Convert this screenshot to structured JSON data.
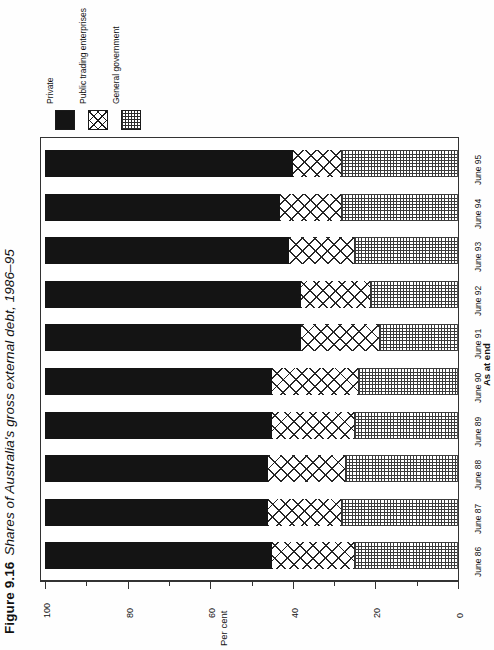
{
  "figure": {
    "number": "Figure 9.16",
    "title": "Shares of Australia's gross external debt, 1986–95"
  },
  "legend": {
    "items": [
      {
        "label": "Private",
        "swatch": "solid-black-swatch",
        "color": "#141414"
      },
      {
        "label": "Public trading enterprises",
        "swatch": "cross-hatch-swatch",
        "color": "#262626"
      },
      {
        "label": "General government",
        "swatch": "dotted-grid-swatch",
        "color": "#3a3a3a"
      }
    ]
  },
  "axes": {
    "value_axis_title": "Per cent",
    "value_ticks": [
      "100",
      "80",
      "60",
      "40",
      "20",
      "0"
    ],
    "category_axis_title": "As at end"
  },
  "chart_data": {
    "type": "bar",
    "orientation": "horizontal-stacked",
    "title": "Shares of Australia's gross external debt, 1986–95",
    "xlabel": "Per cent",
    "ylabel": "As at end",
    "xlim": [
      0,
      100
    ],
    "x_axis_reversed": true,
    "grid": false,
    "legend_position": "top-left",
    "categories": [
      "June 86",
      "June 87",
      "June 88",
      "June 89",
      "June 90",
      "June 91",
      "June 92",
      "June 93",
      "June 94",
      "June 95"
    ],
    "series": [
      {
        "name": "Private",
        "values": [
          55,
          54,
          54,
          55,
          55,
          62,
          62,
          59,
          57,
          60
        ]
      },
      {
        "name": "Public trading enterprises",
        "values": [
          20,
          18,
          19,
          20,
          21,
          19,
          17,
          16,
          15,
          12
        ]
      },
      {
        "name": "General government",
        "values": [
          25,
          28,
          27,
          25,
          24,
          19,
          21,
          25,
          28,
          28
        ]
      }
    ]
  }
}
